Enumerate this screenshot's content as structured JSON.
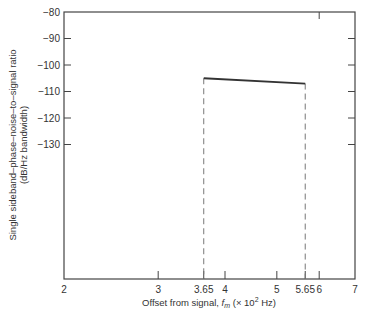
{
  "chart_data": {
    "type": "line",
    "title": "",
    "xlabel": "Offset from signal, f_m (× 10² Hz)",
    "xlabel_parts": {
      "prefix": "Offset from signal, ",
      "var": "f",
      "sub": "m",
      "suffix_open": " (× 10",
      "sup": "2",
      "suffix_close": " Hz)"
    },
    "ylabel_line1": "Single sideband–phase–noise–to–signal ratio",
    "ylabel_line2": "(dB/Hz bandwidth)",
    "x_scale": "log",
    "xlim": [
      2,
      7
    ],
    "ylim": [
      -180,
      -80
    ],
    "x_ticks": [
      2,
      3,
      3.65,
      4,
      5,
      5.65,
      6,
      7
    ],
    "x_tick_labels": [
      "2",
      "3",
      "3.65",
      "4",
      "5",
      "5.65",
      "6",
      "7"
    ],
    "y_ticks": [
      -80,
      -90,
      -100,
      -110,
      -120,
      -130
    ],
    "y_tick_labels": [
      "−80",
      "−90",
      "−100",
      "−110",
      "−120",
      "−130"
    ],
    "grid": false,
    "series": [
      {
        "name": "phase noise",
        "style": "solid",
        "x": [
          3.65,
          5.65
        ],
        "y": [
          -105,
          -107
        ]
      }
    ],
    "annotations": [
      {
        "type": "dashed-vertical",
        "x": 3.65,
        "from_y": -105
      },
      {
        "type": "dashed-vertical",
        "x": 5.65,
        "from_y": -107
      }
    ]
  },
  "colors": {
    "axis": "#444444",
    "line": "#333333",
    "dashed": "#777777",
    "text": "#333333"
  }
}
